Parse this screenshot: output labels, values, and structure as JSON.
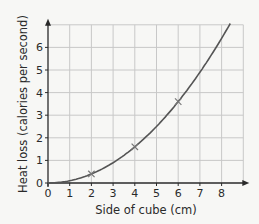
{
  "chart_data": {
    "type": "line",
    "title": "",
    "xlabel": "Side of cube (cm)",
    "ylabel": "Heat loss (calories per second)",
    "xlim": [
      0,
      9
    ],
    "ylim": [
      0,
      7
    ],
    "xticks": [
      0,
      1,
      2,
      3,
      4,
      5,
      6,
      7,
      8
    ],
    "yticks": [
      0,
      1,
      2,
      3,
      4,
      5,
      6
    ],
    "grid": true,
    "series": [
      {
        "name": "Heat loss curve",
        "x": [
          0,
          1,
          2,
          3,
          4,
          5,
          6,
          7,
          8,
          8.4
        ],
        "values": [
          0,
          0.1,
          0.4,
          0.9,
          1.6,
          2.5,
          3.6,
          4.9,
          6.4,
          7.05
        ],
        "style": "line",
        "color": "#555555"
      },
      {
        "name": "Measured points",
        "x": [
          2,
          4,
          6
        ],
        "values": [
          0.4,
          1.6,
          3.6
        ],
        "style": "marker-x",
        "color": "#777777"
      }
    ]
  },
  "colors": {
    "background": "#f7f7f5",
    "grid": "#c8c8c8",
    "axis": "#2a2a2a",
    "curve": "#555555"
  }
}
